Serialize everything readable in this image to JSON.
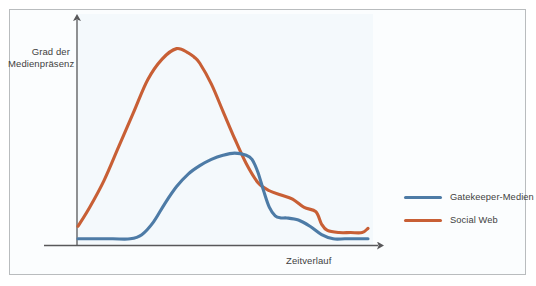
{
  "chart_data": {
    "type": "line",
    "title": "",
    "xlabel": "Zeitverlauf",
    "ylabel": "Grad der\nMedienpräsenz",
    "grid": false,
    "legend_position": "right",
    "axis_style": "arrow-axes",
    "xlim": [
      0,
      100
    ],
    "ylim": [
      0,
      100
    ],
    "series": [
      {
        "name": "Gatekeeper-Medien",
        "color": "#4d7ba6",
        "x": [
          0,
          5,
          12,
          18,
          22,
          26,
          30,
          34,
          38,
          42,
          46,
          50,
          54,
          58,
          60,
          62,
          64,
          66,
          68,
          70,
          72,
          76,
          80,
          84,
          88,
          92,
          96,
          100
        ],
        "values": [
          2,
          2,
          2,
          2,
          4,
          10,
          19,
          27,
          33,
          37,
          40,
          42,
          43,
          42,
          40,
          34,
          25,
          17,
          13,
          12,
          12,
          11,
          8,
          4,
          2,
          2,
          2,
          2
        ]
      },
      {
        "name": "Social Web",
        "color": "#c85f35",
        "x": [
          0,
          4,
          9,
          14,
          19,
          24,
          29,
          34,
          38,
          40,
          42,
          46,
          50,
          54,
          58,
          62,
          66,
          70,
          74,
          78,
          82,
          84,
          86,
          90,
          94,
          98,
          100
        ],
        "values": [
          8,
          17,
          30,
          46,
          62,
          78,
          88,
          93,
          91,
          89,
          86,
          76,
          63,
          50,
          38,
          29,
          25,
          23,
          21,
          17,
          15,
          9,
          6,
          5,
          5,
          5,
          7
        ]
      }
    ]
  },
  "legend": {
    "items": [
      {
        "label": "Gatekeeper-Medien",
        "color": "#4d7ba6"
      },
      {
        "label": "Social Web",
        "color": "#c85f35"
      }
    ]
  },
  "axes": {
    "y_label": "Grad der\nMedienpräsenz",
    "x_label": "Zeitverlauf",
    "axis_color": "#58585a"
  }
}
